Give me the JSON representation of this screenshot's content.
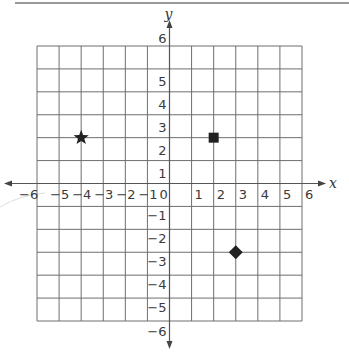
{
  "header_rule": true,
  "diagram": {
    "type": "coordinate-plane",
    "x_axis_label": "x",
    "y_axis_label": "y",
    "x_range": [
      -6,
      6
    ],
    "y_range": [
      -6,
      6
    ],
    "x_ticks": [
      "-6",
      "-5",
      "-4",
      "-3",
      "-2",
      "-1",
      "0",
      "1",
      "2",
      "3",
      "4",
      "5",
      "6"
    ],
    "y_ticks": [
      "6",
      "5",
      "4",
      "3",
      "2",
      "1",
      "-1",
      "-2",
      "-3",
      "-4",
      "-5",
      "-6"
    ],
    "origin_label": "0",
    "points": [
      {
        "shape": "star",
        "x": -4,
        "y": 2
      },
      {
        "shape": "square",
        "x": 2,
        "y": 2
      },
      {
        "shape": "diamond",
        "x": 3,
        "y": -3
      }
    ],
    "colors": {
      "grid": "#6e6e6e",
      "axis": "#555555",
      "marker": "#222222"
    }
  }
}
